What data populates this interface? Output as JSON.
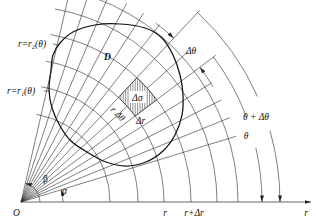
{
  "figure": {
    "labels": {
      "outer_curve": "r=r₂(θ)",
      "inner_curve": "r=r₁(θ)",
      "region": "D",
      "area_element": "Δσ",
      "arc_length": "r Δθ",
      "radial_step": "Δr",
      "delta_theta": "Δθ",
      "theta_plus_delta": "θ + Δθ",
      "theta": "θ",
      "alpha": "α",
      "beta": "β",
      "origin": "O",
      "tick_r": "r",
      "tick_r_plus_dr": "r+Δr",
      "polar_axis": "r"
    },
    "colors": {
      "stroke": "#1a1a1a",
      "background": "#ffffff"
    }
  }
}
